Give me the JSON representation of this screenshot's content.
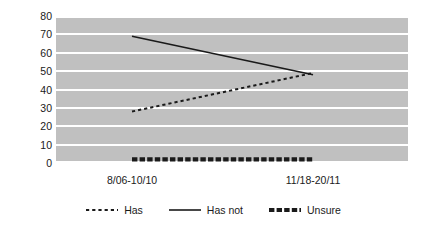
{
  "chart_data": {
    "type": "line",
    "title": "",
    "xlabel": "",
    "ylabel": "Percentage of Respondents",
    "categories": [
      "8/06-10/10",
      "11/18-20/11"
    ],
    "ylim": [
      0,
      80
    ],
    "ytick_step": 10,
    "yticks": [
      80,
      70,
      60,
      50,
      40,
      30,
      20,
      10,
      0
    ],
    "grid": "horizontal-white-gridlines",
    "plot_background": "#c0c0c0",
    "legend_position": "bottom-center",
    "series": [
      {
        "name": "Has",
        "style": "dotted",
        "color": "#1a1a1a",
        "values": [
          28,
          49
        ]
      },
      {
        "name": "Has not",
        "style": "solid",
        "color": "#1a1a1a",
        "values": [
          69,
          48
        ]
      },
      {
        "name": "Unsure",
        "style": "thick-dashed",
        "color": "#1a1a1a",
        "values": [
          2,
          2
        ]
      }
    ]
  },
  "axes": {
    "y_label": "Percentage of Respondents",
    "y_ticks": [
      {
        "label": "80",
        "value": 80
      },
      {
        "label": "70",
        "value": 70
      },
      {
        "label": "60",
        "value": 60
      },
      {
        "label": "50",
        "value": 50
      },
      {
        "label": "40",
        "value": 40
      },
      {
        "label": "30",
        "value": 30
      },
      {
        "label": "20",
        "value": 20
      },
      {
        "label": "10",
        "value": 10
      },
      {
        "label": "0",
        "value": 0
      }
    ],
    "x_ticks": [
      {
        "label": "8/06-10/10"
      },
      {
        "label": "11/18-20/11"
      }
    ]
  },
  "legend": {
    "entries": [
      {
        "label": "Has",
        "style": "dotted"
      },
      {
        "label": "Has not",
        "style": "solid"
      },
      {
        "label": "Unsure",
        "style": "thick-dashed"
      }
    ]
  }
}
